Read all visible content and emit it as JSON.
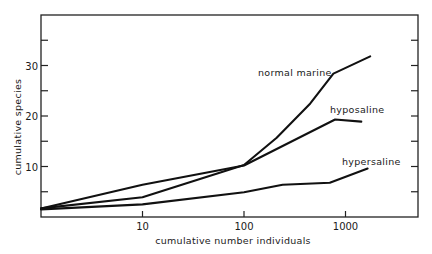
{
  "chart_data": {
    "type": "line",
    "title": "",
    "xlabel": "cumulative number individuals",
    "ylabel": "cumulative species",
    "xscale": "log",
    "xlim": [
      1,
      5000
    ],
    "ylim": [
      0,
      38
    ],
    "x_ticks": [
      10,
      100,
      1000
    ],
    "x_tick_labels": [
      "10",
      "100",
      "1000"
    ],
    "y_ticks": [
      10,
      20,
      30
    ],
    "y_tick_labels": [
      "10",
      "20",
      "30"
    ],
    "y_minor_ticks": [
      5,
      15,
      25,
      35
    ],
    "grid": false,
    "legend": "inline labels",
    "series": [
      {
        "name": "normal marine",
        "points": [
          [
            1,
            1.7
          ],
          [
            10,
            3.9
          ],
          [
            100,
            10.3
          ],
          [
            210,
            15.7
          ],
          [
            450,
            22.5
          ],
          [
            760,
            28.4
          ],
          [
            1750,
            31.8
          ]
        ]
      },
      {
        "name": "hyposaline",
        "points": [
          [
            1,
            1.7
          ],
          [
            10,
            6.4
          ],
          [
            100,
            10.2
          ],
          [
            790,
            19.3
          ],
          [
            1430,
            18.9
          ]
        ]
      },
      {
        "name": "hypersaline",
        "points": [
          [
            1,
            1.5
          ],
          [
            10,
            2.5
          ],
          [
            100,
            4.9
          ],
          [
            240,
            6.4
          ],
          [
            700,
            6.8
          ],
          [
            1650,
            9.6
          ]
        ]
      }
    ],
    "annotations": [
      {
        "text": "normal marine",
        "near_series": "normal marine"
      },
      {
        "text": "hyposaline",
        "near_series": "hyposaline"
      },
      {
        "text": "hypersaline",
        "near_series": "hypersaline"
      }
    ]
  },
  "plot": {
    "line_color": "#111111",
    "frame_color": "#222222"
  }
}
